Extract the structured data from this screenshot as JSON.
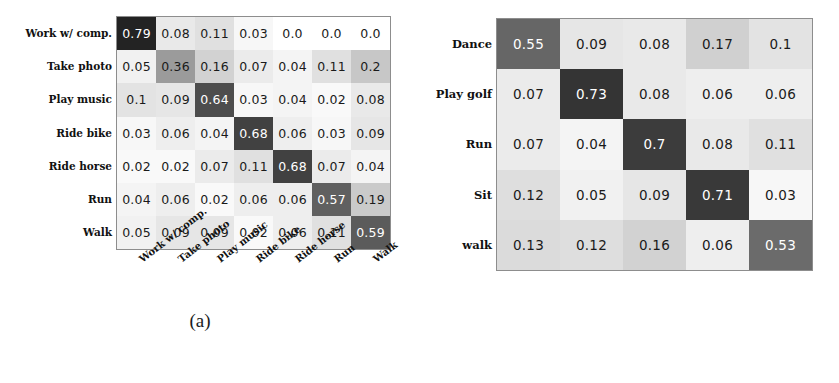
{
  "figure": {
    "caption": "",
    "subcaption_a": "(a)",
    "subcaption_b": "(b)"
  },
  "chart_data": [
    {
      "type": "heatmap",
      "title": "(a)",
      "subtitle": "Confusion matrix (a)",
      "xlabel": "",
      "ylabel": "",
      "grid": false,
      "legend": "none",
      "colormap": "greys",
      "value_range": [
        0.0,
        1.0
      ],
      "row_labels": [
        "Work w/ comp.",
        "Take photo",
        "Play music",
        "Ride bike",
        "Ride horse",
        "Run",
        "Walk"
      ],
      "col_labels": [
        "Work w/ comp.",
        "Take photo",
        "Play music",
        "Ride bike",
        "Ride horse",
        "Run",
        "Walk"
      ],
      "values": [
        [
          0.79,
          0.08,
          0.11,
          0.03,
          0.0,
          0.0,
          0.0
        ],
        [
          0.05,
          0.36,
          0.16,
          0.07,
          0.04,
          0.11,
          0.2
        ],
        [
          0.1,
          0.09,
          0.64,
          0.03,
          0.04,
          0.02,
          0.08
        ],
        [
          0.03,
          0.06,
          0.04,
          0.68,
          0.06,
          0.03,
          0.09
        ],
        [
          0.02,
          0.02,
          0.07,
          0.11,
          0.68,
          0.07,
          0.04
        ],
        [
          0.04,
          0.06,
          0.02,
          0.06,
          0.06,
          0.57,
          0.19
        ],
        [
          0.05,
          0.09,
          0.09,
          0.02,
          0.06,
          0.11,
          0.59
        ]
      ],
      "labels": [
        [
          "0.79",
          "0.08",
          "0.11",
          "0.03",
          "0.0",
          "0.0",
          "0.0"
        ],
        [
          "0.05",
          "0.36",
          "0.16",
          "0.07",
          "0.04",
          "0.11",
          "0.2"
        ],
        [
          "0.1",
          "0.09",
          "0.64",
          "0.03",
          "0.04",
          "0.02",
          "0.08"
        ],
        [
          "0.03",
          "0.06",
          "0.04",
          "0.68",
          "0.06",
          "0.03",
          "0.09"
        ],
        [
          "0.02",
          "0.02",
          "0.07",
          "0.11",
          "0.68",
          "0.07",
          "0.04"
        ],
        [
          "0.04",
          "0.06",
          "0.02",
          "0.06",
          "0.06",
          "0.57",
          "0.19"
        ],
        [
          "0.05",
          "0.09",
          "0.09",
          "0.02",
          "0.06",
          "0.11",
          "0.59"
        ]
      ]
    },
    {
      "type": "heatmap",
      "title": "(b)",
      "subtitle": "Confusion matrix (b)",
      "xlabel": "",
      "ylabel": "",
      "grid": false,
      "legend": "none",
      "colormap": "greys",
      "value_range": [
        0.0,
        1.0
      ],
      "row_labels": [
        "Dance",
        "Play golf",
        "Run",
        "Sit",
        "walk"
      ],
      "col_labels": [
        "Dance",
        "Play golf",
        "Run",
        "Sit",
        "walk"
      ],
      "values": [
        [
          0.55,
          0.09,
          0.08,
          0.17,
          0.1
        ],
        [
          0.07,
          0.73,
          0.08,
          0.06,
          0.06
        ],
        [
          0.07,
          0.04,
          0.7,
          0.08,
          0.11
        ],
        [
          0.12,
          0.05,
          0.09,
          0.71,
          0.03
        ],
        [
          0.13,
          0.12,
          0.16,
          0.06,
          0.53
        ]
      ],
      "labels": [
        [
          "0.55",
          "0.09",
          "0.08",
          "0.17",
          "0.1"
        ],
        [
          "0.07",
          "0.73",
          "0.08",
          "0.06",
          "0.06"
        ],
        [
          "0.07",
          "0.04",
          "0.7",
          "0.08",
          "0.11"
        ],
        [
          "0.12",
          "0.05",
          "0.09",
          "0.71",
          "0.03"
        ],
        [
          "0.13",
          "0.12",
          "0.16",
          "0.06",
          "0.53"
        ]
      ]
    }
  ],
  "colors": {
    "cell_max": "#262626",
    "cell_mid": "#9a9a9a",
    "cell_min": "#ffffff",
    "grid_line": "#8d8d8d",
    "text_dark": "#1a1a1a",
    "text_light": "#ffffff"
  }
}
